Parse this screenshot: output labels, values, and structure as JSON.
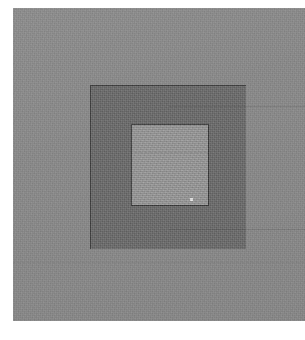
{
  "image": {
    "title": "Nested gray squares",
    "description": "Photographic grayscale image: a grainy mid-gray field containing a darker gray square, which in turn contains a lighter gray square outlined in near-black, with a single small white speck near its lower-right interior.",
    "canvas": {
      "width": 305,
      "height": 340,
      "background_color": "#ffffff"
    }
  },
  "regions": {
    "gray_field": {
      "label": "gray field",
      "color": "#8a8a8a",
      "x": 13,
      "y": 8,
      "width": 292,
      "height": 313,
      "texture": "grain"
    },
    "outer_square": {
      "label": "outer dark square",
      "color": "#6a6a6a",
      "outline_color": "#3e3e3e",
      "x": 90,
      "y": 85,
      "width": 156,
      "height": 164
    },
    "inner_square": {
      "label": "inner light square",
      "color": "#9b9b9b",
      "outline_color": "#363636",
      "x": 130,
      "y": 123,
      "width": 78,
      "height": 82
    },
    "white_dot": {
      "label": "white speck",
      "color": "#f2f2f2",
      "x": 188,
      "y": 196,
      "width": 3,
      "height": 3
    }
  },
  "artifacts": {
    "seams": [
      {
        "label": "upper seam line",
        "y": 105
      },
      {
        "label": "inner seam line",
        "y": 150
      },
      {
        "label": "lower seam line",
        "y": 228
      },
      {
        "label": "field seam line",
        "y": 262
      }
    ]
  }
}
